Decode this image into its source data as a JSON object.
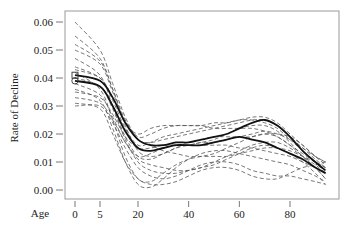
{
  "chart_data": {
    "type": "line",
    "title": "",
    "xlabel": "Age",
    "ylabel": "Rate of Decline",
    "xlim": [
      -2,
      96
    ],
    "ylim": [
      -0.003,
      0.063
    ],
    "x_ticks": [
      0,
      5,
      20,
      40,
      60,
      80
    ],
    "x_tick_labels": [
      "0",
      "5",
      "20",
      "40",
      "60",
      "80"
    ],
    "y_ticks": [
      0.0,
      0.01,
      0.02,
      0.03,
      0.04,
      0.05,
      0.06
    ],
    "y_tick_labels": [
      "0.00",
      "0.01",
      "0.02",
      "0.03",
      "0.04",
      "0.05",
      "0.06"
    ],
    "grid": false,
    "legend": null,
    "x": [
      0,
      5,
      10,
      15,
      20,
      25,
      30,
      35,
      40,
      45,
      50,
      55,
      60,
      65,
      70,
      75,
      80,
      85,
      90,
      94
    ],
    "series": [
      {
        "name": "mean-1",
        "style": "solid-bold",
        "marker": "circle",
        "values": [
          0.039,
          0.037,
          0.03,
          0.021,
          0.015,
          0.014,
          0.015,
          0.016,
          0.016,
          0.016,
          0.017,
          0.018,
          0.019,
          0.018,
          0.017,
          0.015,
          0.013,
          0.011,
          0.008,
          0.006
        ]
      },
      {
        "name": "mean-2",
        "style": "solid-bold",
        "marker": "square",
        "values": [
          0.041,
          0.039,
          0.033,
          0.024,
          0.018,
          0.016,
          0.016,
          0.017,
          0.017,
          0.018,
          0.019,
          0.02,
          0.022,
          0.024,
          0.025,
          0.023,
          0.019,
          0.014,
          0.01,
          0.007
        ]
      },
      {
        "name": "pop-1",
        "style": "dashed",
        "values": [
          0.06,
          0.05,
          0.038,
          0.026,
          0.018,
          0.017,
          0.018,
          0.019,
          0.02,
          0.021,
          0.022,
          0.023,
          0.024,
          0.025,
          0.025,
          0.023,
          0.019,
          0.015,
          0.011,
          0.008
        ]
      },
      {
        "name": "pop-2",
        "style": "dashed",
        "values": [
          0.055,
          0.047,
          0.036,
          0.025,
          0.019,
          0.02,
          0.022,
          0.023,
          0.023,
          0.023,
          0.022,
          0.022,
          0.022,
          0.022,
          0.021,
          0.019,
          0.016,
          0.013,
          0.01,
          0.008
        ]
      },
      {
        "name": "pop-3",
        "style": "dashed",
        "values": [
          0.05,
          0.045,
          0.035,
          0.024,
          0.02,
          0.022,
          0.023,
          0.023,
          0.023,
          0.023,
          0.024,
          0.024,
          0.025,
          0.026,
          0.026,
          0.024,
          0.02,
          0.016,
          0.012,
          0.01
        ]
      },
      {
        "name": "pop-4",
        "style": "dashed",
        "values": [
          0.047,
          0.041,
          0.03,
          0.019,
          0.012,
          0.011,
          0.013,
          0.015,
          0.016,
          0.017,
          0.018,
          0.02,
          0.022,
          0.023,
          0.023,
          0.021,
          0.017,
          0.012,
          0.008,
          0.004
        ]
      },
      {
        "name": "pop-5",
        "style": "dashed",
        "values": [
          0.044,
          0.04,
          0.032,
          0.022,
          0.016,
          0.017,
          0.019,
          0.02,
          0.021,
          0.022,
          0.023,
          0.024,
          0.025,
          0.025,
          0.024,
          0.022,
          0.018,
          0.014,
          0.01,
          0.006
        ]
      },
      {
        "name": "pop-6",
        "style": "dashed",
        "values": [
          0.042,
          0.036,
          0.025,
          0.012,
          0.004,
          0.003,
          0.006,
          0.009,
          0.011,
          0.012,
          0.013,
          0.015,
          0.017,
          0.019,
          0.02,
          0.019,
          0.016,
          0.012,
          0.008,
          0.004
        ]
      },
      {
        "name": "pop-7",
        "style": "dashed",
        "values": [
          0.038,
          0.034,
          0.026,
          0.017,
          0.012,
          0.013,
          0.015,
          0.016,
          0.016,
          0.017,
          0.017,
          0.018,
          0.019,
          0.02,
          0.021,
          0.02,
          0.018,
          0.015,
          0.012,
          0.01
        ]
      },
      {
        "name": "pop-8",
        "style": "dashed",
        "values": [
          0.036,
          0.032,
          0.022,
          0.01,
          0.002,
          0.001,
          0.004,
          0.008,
          0.011,
          0.013,
          0.014,
          0.014,
          0.013,
          0.012,
          0.011,
          0.01,
          0.009,
          0.007,
          0.005,
          0.003
        ]
      },
      {
        "name": "pop-9",
        "style": "dashed",
        "values": [
          0.033,
          0.031,
          0.025,
          0.017,
          0.011,
          0.009,
          0.008,
          0.007,
          0.007,
          0.008,
          0.009,
          0.011,
          0.013,
          0.015,
          0.016,
          0.015,
          0.013,
          0.01,
          0.006,
          0.002
        ]
      },
      {
        "name": "pop-10",
        "style": "dashed",
        "values": [
          0.03,
          0.03,
          0.024,
          0.015,
          0.008,
          0.005,
          0.004,
          0.005,
          0.007,
          0.009,
          0.01,
          0.01,
          0.009,
          0.007,
          0.006,
          0.005,
          0.005,
          0.004,
          0.003,
          0.002
        ]
      },
      {
        "name": "pop-11",
        "style": "dashed",
        "values": [
          0.031,
          0.029,
          0.02,
          0.01,
          0.004,
          0.002,
          0.002,
          0.003,
          0.005,
          0.007,
          0.008,
          0.008,
          0.007,
          0.005,
          0.004,
          0.004,
          0.006,
          0.008,
          0.009,
          0.01
        ]
      },
      {
        "name": "pop-12",
        "style": "dashed",
        "values": [
          0.043,
          0.04,
          0.033,
          0.024,
          0.018,
          0.016,
          0.014,
          0.013,
          0.012,
          0.012,
          0.012,
          0.012,
          0.013,
          0.014,
          0.015,
          0.015,
          0.014,
          0.012,
          0.01,
          0.008
        ]
      },
      {
        "name": "pop-13",
        "style": "dashed",
        "values": [
          0.052,
          0.046,
          0.036,
          0.023,
          0.014,
          0.012,
          0.013,
          0.015,
          0.017,
          0.018,
          0.019,
          0.019,
          0.019,
          0.019,
          0.02,
          0.02,
          0.019,
          0.016,
          0.012,
          0.009
        ]
      },
      {
        "name": "pop-14",
        "style": "dashed",
        "values": [
          0.035,
          0.033,
          0.027,
          0.019,
          0.015,
          0.015,
          0.016,
          0.016,
          0.016,
          0.016,
          0.016,
          0.016,
          0.015,
          0.015,
          0.014,
          0.013,
          0.012,
          0.01,
          0.008,
          0.006
        ]
      },
      {
        "name": "pop-15",
        "style": "dashed",
        "values": [
          0.04,
          0.037,
          0.029,
          0.018,
          0.01,
          0.007,
          0.006,
          0.006,
          0.007,
          0.008,
          0.01,
          0.012,
          0.014,
          0.016,
          0.017,
          0.017,
          0.015,
          0.012,
          0.009,
          0.006
        ]
      }
    ]
  }
}
